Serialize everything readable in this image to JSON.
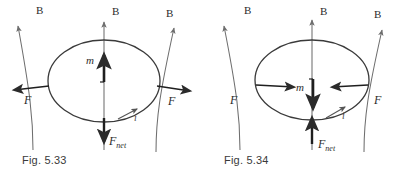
{
  "sheet": {
    "title": "Current loop in a non-uniform magnetic field",
    "background_color": "#ffffff",
    "ink_color": "#2b2b2b",
    "field_line_color": "#6e6e6e",
    "caption_color": "#3a3a3a"
  },
  "figures": [
    {
      "id": "fig-5-33",
      "caption": "Fig. 5.33",
      "description": "Current loop with magnetic moment parallel to the diverging field; forces splay outward and the net force is downward.",
      "labels": {
        "field_left": "B",
        "field_center": "B",
        "field_right": "B",
        "force_left": "F",
        "force_right": "F",
        "moment": "m",
        "current": "i",
        "net_force_symbol": "F",
        "net_force_subscript": "net"
      },
      "vectors": {
        "moment_direction": "up",
        "net_force_direction": "down",
        "force_left_direction": "left",
        "force_right_direction": "right"
      }
    },
    {
      "id": "fig-5-34",
      "caption": "Fig. 5.34",
      "description": "Current loop with magnetic moment antiparallel to the diverging field; forces converge inward and the net force is upward.",
      "labels": {
        "field_left": "B",
        "field_center": "B",
        "field_right": "B",
        "force_left": "F",
        "force_right": "F",
        "moment": "m",
        "current": "i",
        "net_force_symbol": "F",
        "net_force_subscript": "net"
      },
      "vectors": {
        "moment_direction": "down",
        "net_force_direction": "up",
        "force_left_direction": "right",
        "force_right_direction": "left"
      }
    }
  ]
}
